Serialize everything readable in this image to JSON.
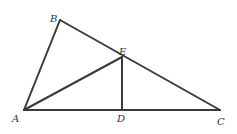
{
  "diagram": {
    "type": "geometry-triangle",
    "background": "#ffffff",
    "line_color": "#3a3a3a",
    "points": {
      "A": {
        "x": 24,
        "y": 110
      },
      "B": {
        "x": 60,
        "y": 20
      },
      "C": {
        "x": 220,
        "y": 110
      },
      "D": {
        "x": 122,
        "y": 110
      },
      "E": {
        "x": 122,
        "y": 57
      }
    },
    "segments": [
      {
        "from": "A",
        "to": "B"
      },
      {
        "from": "B",
        "to": "C"
      },
      {
        "from": "A",
        "to": "C"
      },
      {
        "from": "A",
        "to": "E"
      },
      {
        "from": "E",
        "to": "D"
      }
    ],
    "labels": {
      "A": "A",
      "B": "B",
      "C": "C",
      "D": "D",
      "E": "E"
    }
  }
}
